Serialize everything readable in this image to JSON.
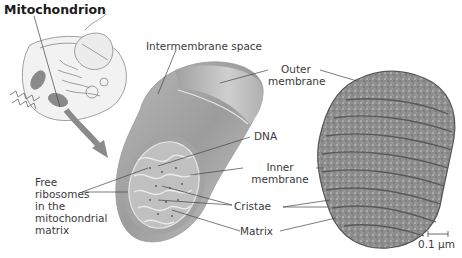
{
  "title": "Mitochondrion",
  "labels": {
    "intermembrane_space": "Intermembrane space",
    "outer_membrane_line1": "Outer",
    "outer_membrane_line2": "membrane",
    "dna": "DNA",
    "inner_membrane_line1": "Inner",
    "inner_membrane_line2": "membrane",
    "cristae": "Cristae",
    "matrix": "Matrix",
    "free_ribosomes_lines": [
      "Free",
      "ribosomes",
      "in the",
      "mitochondrial",
      "matrix"
    ]
  },
  "scale_bar": "0.1 µm",
  "colors": {
    "membrane_gray": "#9a9a9a",
    "em_texture": "#7d7d7d",
    "arrow": "#8a8a8a",
    "text": "#3a3a3a",
    "title": "#1a1a1a"
  }
}
